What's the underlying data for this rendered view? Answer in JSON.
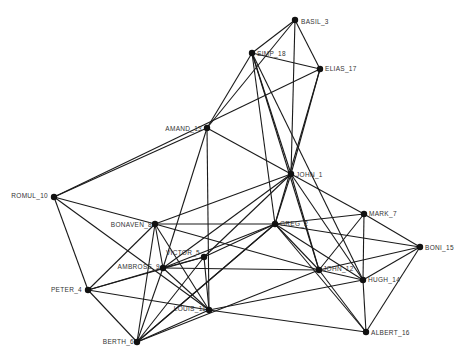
{
  "diagram": {
    "type": "network-graph",
    "colors": {
      "edge": "#1a1a1a",
      "node": "#111111",
      "label": "#333333",
      "background": "#ffffff"
    },
    "nodes": [
      {
        "id": "BASIL_3",
        "label": "BASIL_3",
        "x": 295,
        "y": 20,
        "lx": 6,
        "ly": 2,
        "anchor": "start"
      },
      {
        "id": "SIMP_18",
        "label": "SIMP_18",
        "x": 252,
        "y": 53,
        "lx": 5,
        "ly": 1,
        "anchor": "start"
      },
      {
        "id": "ELIAS_17",
        "label": "ELIAS_17",
        "x": 320,
        "y": 69,
        "lx": 5,
        "ly": 0,
        "anchor": "start"
      },
      {
        "id": "AMAND_13",
        "label": "AMAND_13",
        "x": 207,
        "y": 128,
        "lx": -5,
        "ly": 1,
        "anchor": "end"
      },
      {
        "id": "JOHN_1",
        "label": "JOHN_1",
        "x": 291,
        "y": 174,
        "lx": 5,
        "ly": 1,
        "anchor": "start"
      },
      {
        "id": "ROMUL_10",
        "label": "ROMUL_10",
        "x": 54,
        "y": 197,
        "lx": -6,
        "ly": -1,
        "anchor": "end"
      },
      {
        "id": "BONAVEN_8",
        "label": "BONAVEN_8",
        "x": 155,
        "y": 224,
        "lx": -3,
        "ly": 1,
        "anchor": "end"
      },
      {
        "id": "GREG_2",
        "label": "GREG_2",
        "x": 275,
        "y": 224,
        "lx": 5,
        "ly": 0,
        "anchor": "start"
      },
      {
        "id": "MARK_7",
        "label": "MARK_7",
        "x": 364,
        "y": 214,
        "lx": 5,
        "ly": 0,
        "anchor": "start"
      },
      {
        "id": "BONI_15",
        "label": "BONI_15",
        "x": 420,
        "y": 247,
        "lx": 5,
        "ly": 1,
        "anchor": "start"
      },
      {
        "id": "VICTOR_5",
        "label": "VICTOR_5",
        "x": 204,
        "y": 257,
        "lx": -4,
        "ly": -4,
        "anchor": "end"
      },
      {
        "id": "AMBROSE_9",
        "label": "AMBROSE_9",
        "x": 163,
        "y": 268,
        "lx": -3,
        "ly": -1,
        "anchor": "end"
      },
      {
        "id": "JOHN_12",
        "label": "JOHN_12",
        "x": 319,
        "y": 270,
        "lx": 4,
        "ly": -1,
        "anchor": "start"
      },
      {
        "id": "HUGH_14",
        "label": "HUGH_14",
        "x": 363,
        "y": 280,
        "lx": 5,
        "ly": 0,
        "anchor": "start"
      },
      {
        "id": "PETER_4",
        "label": "PETER_4",
        "x": 88,
        "y": 290,
        "lx": -6,
        "ly": 0,
        "anchor": "end"
      },
      {
        "id": "LOUIS_11",
        "label": "LOUIS_11",
        "x": 209,
        "y": 310,
        "lx": -3,
        "ly": -1,
        "anchor": "end"
      },
      {
        "id": "BERTH_6",
        "label": "BERTH_6",
        "x": 137,
        "y": 342,
        "lx": -3,
        "ly": 0,
        "anchor": "end"
      },
      {
        "id": "ALBERT_16",
        "label": "ALBERT_16",
        "x": 366,
        "y": 332,
        "lx": 5,
        "ly": 1,
        "anchor": "start"
      }
    ],
    "edges": [
      [
        "BASIL_3",
        "SIMP_18"
      ],
      [
        "BASIL_3",
        "ELIAS_17"
      ],
      [
        "BASIL_3",
        "JOHN_1"
      ],
      [
        "BASIL_3",
        "AMAND_13"
      ],
      [
        "SIMP_18",
        "ELIAS_17"
      ],
      [
        "SIMP_18",
        "AMAND_13"
      ],
      [
        "SIMP_18",
        "JOHN_1"
      ],
      [
        "SIMP_18",
        "GREG_2"
      ],
      [
        "SIMP_18",
        "JOHN_12"
      ],
      [
        "SIMP_18",
        "HUGH_14"
      ],
      [
        "ELIAS_17",
        "ROMUL_10"
      ],
      [
        "ELIAS_17",
        "JOHN_1"
      ],
      [
        "ELIAS_17",
        "GREG_2"
      ],
      [
        "AMAND_13",
        "ROMUL_10"
      ],
      [
        "AMAND_13",
        "JOHN_1"
      ],
      [
        "AMAND_13",
        "AMBROSE_9"
      ],
      [
        "AMAND_13",
        "LOUIS_11"
      ],
      [
        "JOHN_1",
        "BONAVEN_8"
      ],
      [
        "JOHN_1",
        "GREG_2"
      ],
      [
        "JOHN_1",
        "MARK_7"
      ],
      [
        "JOHN_1",
        "JOHN_12"
      ],
      [
        "JOHN_1",
        "HUGH_14"
      ],
      [
        "JOHN_1",
        "VICTOR_5"
      ],
      [
        "JOHN_1",
        "AMBROSE_9"
      ],
      [
        "ROMUL_10",
        "BONAVEN_8"
      ],
      [
        "ROMUL_10",
        "PETER_4"
      ],
      [
        "ROMUL_10",
        "LOUIS_11"
      ],
      [
        "BONAVEN_8",
        "GREG_2"
      ],
      [
        "BONAVEN_8",
        "PETER_4"
      ],
      [
        "BONAVEN_8",
        "BERTH_6"
      ],
      [
        "BONAVEN_8",
        "LOUIS_11"
      ],
      [
        "BONAVEN_8",
        "AMBROSE_9"
      ],
      [
        "BONAVEN_8",
        "JOHN_12"
      ],
      [
        "GREG_2",
        "MARK_7"
      ],
      [
        "GREG_2",
        "BONI_15"
      ],
      [
        "GREG_2",
        "JOHN_12"
      ],
      [
        "GREG_2",
        "HUGH_14"
      ],
      [
        "GREG_2",
        "VICTOR_5"
      ],
      [
        "GREG_2",
        "AMBROSE_9"
      ],
      [
        "GREG_2",
        "BERTH_6"
      ],
      [
        "GREG_2",
        "ALBERT_16"
      ],
      [
        "MARK_7",
        "BONI_15"
      ],
      [
        "MARK_7",
        "JOHN_12"
      ],
      [
        "MARK_7",
        "HUGH_14"
      ],
      [
        "BONI_15",
        "JOHN_12"
      ],
      [
        "BONI_15",
        "HUGH_14"
      ],
      [
        "BONI_15",
        "ALBERT_16"
      ],
      [
        "VICTOR_5",
        "AMBROSE_9"
      ],
      [
        "VICTOR_5",
        "LOUIS_11"
      ],
      [
        "VICTOR_5",
        "PETER_4"
      ],
      [
        "VICTOR_5",
        "BERTH_6"
      ],
      [
        "AMBROSE_9",
        "PETER_4"
      ],
      [
        "AMBROSE_9",
        "BERTH_6"
      ],
      [
        "AMBROSE_9",
        "LOUIS_11"
      ],
      [
        "AMBROSE_9",
        "JOHN_12"
      ],
      [
        "JOHN_12",
        "HUGH_14"
      ],
      [
        "JOHN_12",
        "ALBERT_16"
      ],
      [
        "JOHN_12",
        "BERTH_6"
      ],
      [
        "HUGH_14",
        "ALBERT_16"
      ],
      [
        "HUGH_14",
        "LOUIS_11"
      ],
      [
        "PETER_4",
        "BERTH_6"
      ],
      [
        "PETER_4",
        "LOUIS_11"
      ],
      [
        "LOUIS_11",
        "BERTH_6"
      ],
      [
        "LOUIS_11",
        "ALBERT_16"
      ],
      [
        "BERTH_6",
        "GREG_2"
      ]
    ]
  }
}
